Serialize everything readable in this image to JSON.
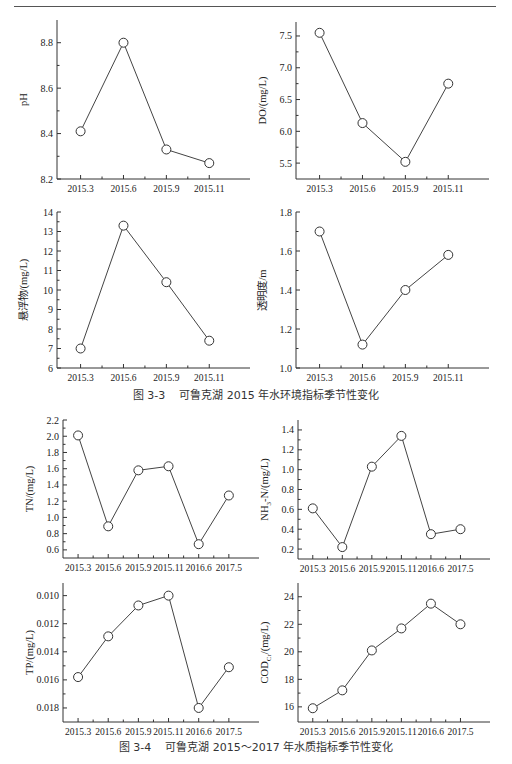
{
  "figures": [
    {
      "id": "fig-3-3",
      "caption_number": "图 3-3",
      "caption_text": "可鲁克湖 2015 年水环境指标季节性变化"
    },
    {
      "id": "fig-3-4",
      "caption_number": "图 3-4",
      "caption_text": "可鲁克湖 2015～2017 年水质指标季节性变化"
    }
  ],
  "chart_data": [
    {
      "type": "line",
      "title": "",
      "ylabel": "pH",
      "xlabel": "",
      "categories": [
        "2015.3",
        "2015.6",
        "2015.9",
        "2015.11"
      ],
      "values": [
        8.41,
        8.8,
        8.33,
        8.27
      ],
      "ylim": [
        8.2,
        8.9
      ],
      "yticks": [
        8.2,
        8.4,
        8.6,
        8.8
      ],
      "ytick_labels": [
        "8.2",
        "8.4",
        "8.6",
        "8.8"
      ],
      "reversed": false,
      "grid": false,
      "marker": "open-circle",
      "box": {
        "left": 57,
        "top": 20,
        "width": 193,
        "height": 159
      }
    },
    {
      "type": "line",
      "title": "",
      "ylabel": "DO/(mg/L)",
      "xlabel": "",
      "categories": [
        "2015.3",
        "2015.6",
        "2015.9",
        "2015.11"
      ],
      "values": [
        7.55,
        6.13,
        5.52,
        6.75
      ],
      "ylim": [
        5.25,
        7.72
      ],
      "yticks": [
        5.5,
        6.0,
        6.5,
        7.0,
        7.5
      ],
      "ytick_labels": [
        "5.5",
        "6.0",
        "6.5",
        "7.0",
        "7.5"
      ],
      "reversed": false,
      "grid": false,
      "marker": "open-circle",
      "box": {
        "left": 296,
        "top": 22,
        "width": 193,
        "height": 157
      }
    },
    {
      "type": "line",
      "title": "",
      "ylabel": "悬浮物/(mg/L)",
      "xlabel": "",
      "categories": [
        "2015.3",
        "2015.6",
        "2015.9",
        "2015.11"
      ],
      "values": [
        7.0,
        13.3,
        10.4,
        7.4
      ],
      "ylim": [
        6,
        14
      ],
      "yticks": [
        6,
        7,
        8,
        9,
        10,
        11,
        12,
        13,
        14
      ],
      "ytick_labels": [
        "6",
        "7",
        "8",
        "9",
        "10",
        "11",
        "12",
        "13",
        "14"
      ],
      "reversed": false,
      "grid": false,
      "marker": "open-circle",
      "box": {
        "left": 57,
        "top": 212,
        "width": 193,
        "height": 156
      }
    },
    {
      "type": "line",
      "title": "",
      "ylabel": "透明度/m",
      "xlabel": "",
      "categories": [
        "2015.3",
        "2015.6",
        "2015.9",
        "2015.11"
      ],
      "values": [
        1.7,
        1.12,
        1.4,
        1.58
      ],
      "ylim": [
        1.0,
        1.8
      ],
      "yticks": [
        1.0,
        1.2,
        1.4,
        1.6,
        1.8
      ],
      "ytick_labels": [
        "1.0",
        "1.2",
        "1.4",
        "1.6",
        "1.8"
      ],
      "reversed": false,
      "grid": false,
      "marker": "open-circle",
      "box": {
        "left": 296,
        "top": 212,
        "width": 193,
        "height": 156
      }
    },
    {
      "type": "line",
      "title": "",
      "ylabel": "TN/(mg/L)",
      "xlabel": "",
      "categories": [
        "2015.3",
        "2015.6",
        "2015.9",
        "2015.11",
        "2016.6",
        "2017.5"
      ],
      "values": [
        2.01,
        0.89,
        1.58,
        1.63,
        0.67,
        1.27
      ],
      "ylim": [
        0.5,
        2.2
      ],
      "yticks": [
        0.6,
        0.8,
        1.0,
        1.2,
        1.4,
        1.6,
        1.8,
        2.0,
        2.2
      ],
      "ytick_labels": [
        "0.6",
        "0.8",
        "1.0",
        "1.2",
        "1.4",
        "1.6",
        "1.8",
        "2.0",
        "2.2"
      ],
      "reversed": false,
      "grid": false,
      "marker": "open-circle",
      "box": {
        "left": 63,
        "top": 420,
        "width": 196,
        "height": 138
      }
    },
    {
      "type": "line",
      "title": "",
      "ylabel": "NH3-N/(mg/L)",
      "xlabel": "",
      "categories": [
        "2015.3",
        "2015.6",
        "2015.9",
        "2015.11",
        "2016.6",
        "2017.5"
      ],
      "values": [
        0.61,
        0.22,
        1.03,
        1.34,
        0.35,
        0.4
      ],
      "ylim": [
        0.1,
        1.5
      ],
      "yticks": [
        0.2,
        0.4,
        0.6,
        0.8,
        1.0,
        1.2,
        1.4
      ],
      "ytick_labels": [
        "0.2",
        "0.4",
        "0.6",
        "0.8",
        "1.0",
        "1.2",
        "1.4"
      ],
      "reversed": false,
      "grid": false,
      "marker": "open-circle",
      "box": {
        "left": 298,
        "top": 420,
        "width": 192,
        "height": 139
      }
    },
    {
      "type": "line",
      "title": "",
      "ylabel": "TP/(mg/L)",
      "xlabel": "",
      "categories": [
        "2015.3",
        "2015.6",
        "2015.9",
        "2015.11",
        "2016.6",
        "2017.5"
      ],
      "values": [
        0.0158,
        0.0129,
        0.0107,
        0.01,
        0.018,
        0.0151
      ],
      "ylim": [
        0.0091,
        0.019
      ],
      "yticks": [
        0.01,
        0.012,
        0.014,
        0.016,
        0.018
      ],
      "ytick_labels": [
        "0.010",
        "0.012",
        "0.014",
        "0.016",
        "0.018"
      ],
      "reversed": true,
      "grid": false,
      "marker": "open-circle",
      "box": {
        "left": 63,
        "top": 583,
        "width": 196,
        "height": 139
      }
    },
    {
      "type": "line",
      "title": "",
      "ylabel": "CODCr/(mg/L)",
      "xlabel": "",
      "categories": [
        "2015.3",
        "2015.6",
        "2015.9",
        "2015.11",
        "2016.6",
        "2017.5"
      ],
      "values": [
        15.9,
        17.2,
        20.1,
        21.7,
        23.5,
        22.0
      ],
      "ylim": [
        14.9,
        25.0
      ],
      "yticks": [
        16,
        18,
        20,
        22,
        24
      ],
      "ytick_labels": [
        "16",
        "18",
        "20",
        "22",
        "24"
      ],
      "reversed": false,
      "grid": false,
      "marker": "open-circle",
      "box": {
        "left": 298,
        "top": 583,
        "width": 192,
        "height": 139
      }
    }
  ]
}
